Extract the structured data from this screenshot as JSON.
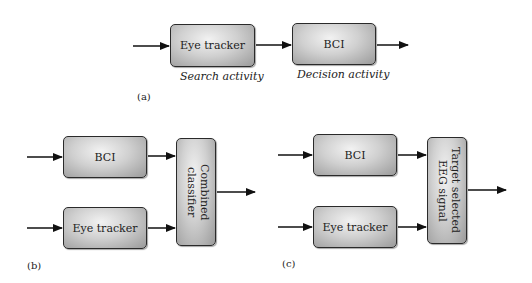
{
  "panel_a": {
    "label": "(a)",
    "blocks": [
      {
        "id": "eye-tracker",
        "text": "Eye tracker",
        "caption": "Search activity"
      },
      {
        "id": "bci",
        "text": "BCI",
        "caption": "Decision activity"
      }
    ]
  },
  "panel_b": {
    "label": "(b)",
    "blocks": [
      {
        "id": "bci",
        "text": "BCI"
      },
      {
        "id": "eye-tracker",
        "text": "Eye tracker"
      },
      {
        "id": "combined-classifier",
        "text": "Combined classifier"
      }
    ]
  },
  "panel_c": {
    "label": "(c)",
    "blocks": [
      {
        "id": "bci",
        "text": "BCI"
      },
      {
        "id": "eye-tracker",
        "text": "Eye tracker"
      },
      {
        "id": "target-selected",
        "text": "Target selected EEG signal"
      }
    ]
  }
}
